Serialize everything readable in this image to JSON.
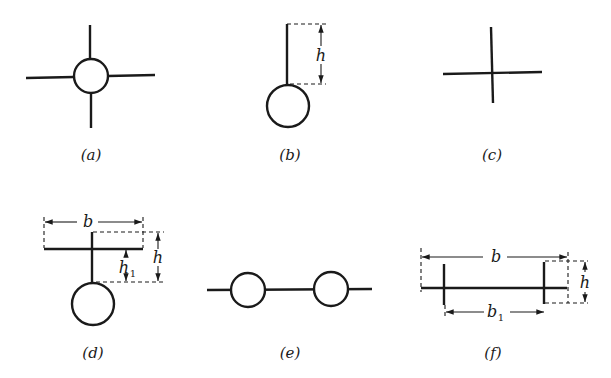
{
  "figure": {
    "panels": [
      {
        "id": "a",
        "caption": "(a)",
        "shape": "circle-with-four-arms"
      },
      {
        "id": "b",
        "caption": "(b)",
        "shape": "circle-with-vertical-stem",
        "dimensions": {
          "h": "h"
        }
      },
      {
        "id": "c",
        "caption": "(c)",
        "shape": "plain-cross"
      },
      {
        "id": "d",
        "caption": "(d)",
        "shape": "circle-with-stem-and-flange",
        "dimensions": {
          "b": "b",
          "h": "h",
          "h1": "h",
          "h1_sub": "1"
        }
      },
      {
        "id": "e",
        "caption": "(e)",
        "shape": "two-circles-on-line"
      },
      {
        "id": "f",
        "caption": "(f)",
        "shape": "flange-with-two-webs",
        "dimensions": {
          "b": "b",
          "h": "h",
          "b1": "b",
          "b1_sub": "1"
        }
      }
    ]
  }
}
